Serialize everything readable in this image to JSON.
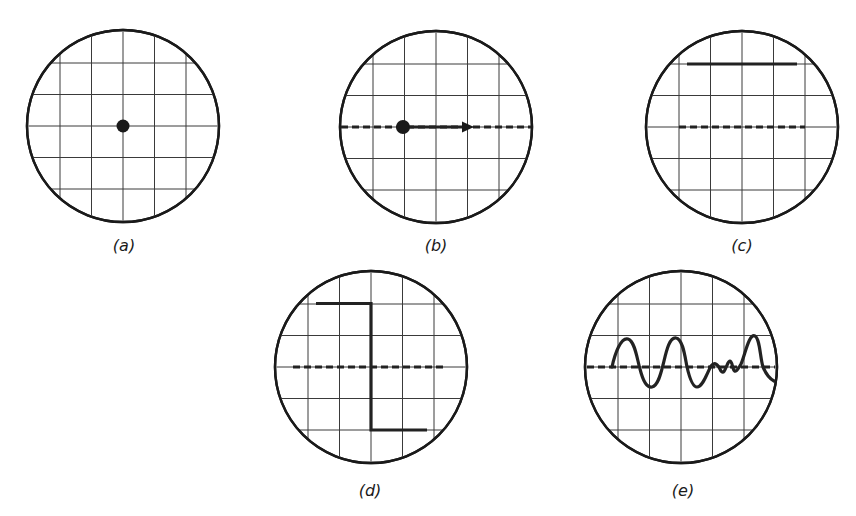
{
  "figure": {
    "panels": [
      {
        "id": "a",
        "label": "(a)",
        "description": "Stationary spot at screen center",
        "trace": "dot",
        "center": [
          123,
          126
        ]
      },
      {
        "id": "b",
        "label": "(b)",
        "description": "Spot deflected horizontally along dashed baseline with arrow",
        "trace": "dot-with-arrow",
        "center": [
          436,
          127
        ]
      },
      {
        "id": "c",
        "label": "(c)",
        "description": "Horizontal trace shifted upward above dashed baseline",
        "trace": "dc-offset-line",
        "center": [
          742,
          127
        ]
      },
      {
        "id": "d",
        "label": "(d)",
        "description": "Step waveform crossing dashed baseline",
        "trace": "step",
        "center": [
          371,
          367
        ]
      },
      {
        "id": "e",
        "label": "(e)",
        "description": "Irregular oscillating waveform about dashed baseline",
        "trace": "oscillation",
        "center": [
          681,
          367
        ]
      }
    ],
    "graticule": {
      "divisions": 6,
      "radius_px": 96
    },
    "colors": {
      "ink": "#1a1a1a",
      "grid": "#3a3a3a",
      "background": "#ffffff"
    }
  }
}
